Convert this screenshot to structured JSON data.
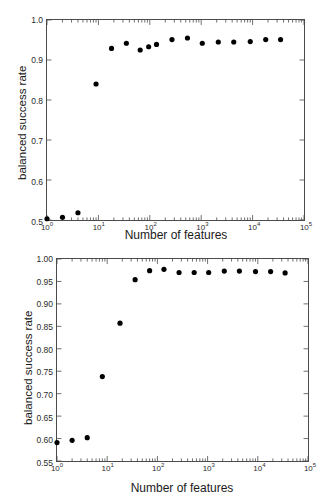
{
  "chart_data": [
    {
      "id": "top",
      "type": "scatter",
      "title": "",
      "xlabel": "Number of features",
      "ylabel": "balanced success rate",
      "xscale": "log",
      "xlim": [
        1,
        100000
      ],
      "ylim": [
        0.5,
        1.0
      ],
      "grid": false,
      "legend": false,
      "xticks": [
        1,
        10,
        100,
        1000,
        10000,
        100000
      ],
      "xticklabels": [
        "10",
        "10",
        "10",
        "10",
        "10",
        "10"
      ],
      "xtickexp": [
        "0",
        "1",
        "2",
        "3",
        "4",
        "5"
      ],
      "yticks": [
        0.5,
        0.6,
        0.7,
        0.8,
        0.9,
        1.0
      ],
      "yticklabels": [
        "0.5",
        "0.6",
        "0.7",
        "0.8",
        "0.9",
        "1.0"
      ],
      "marker": "circle",
      "marker_color": "#000000",
      "x": [
        1,
        2,
        4,
        9,
        18,
        35,
        65,
        95,
        135,
        270,
        540,
        1050,
        2150,
        4300,
        9000,
        18000,
        35000
      ],
      "y": [
        0.503,
        0.507,
        0.518,
        0.84,
        0.929,
        0.942,
        0.925,
        0.933,
        0.939,
        0.951,
        0.955,
        0.942,
        0.945,
        0.945,
        0.946,
        0.951,
        0.951
      ]
    },
    {
      "id": "bottom",
      "type": "scatter",
      "title": "",
      "xlabel": "Number of features",
      "ylabel": "balanced success rate",
      "xscale": "log",
      "xlim": [
        1,
        100000
      ],
      "ylim": [
        0.55,
        1.0
      ],
      "grid": false,
      "legend": false,
      "xticks": [
        1,
        10,
        100,
        1000,
        10000,
        100000
      ],
      "xticklabels": [
        "10",
        "10",
        "10",
        "10",
        "10",
        "10"
      ],
      "xtickexp": [
        "0",
        "1",
        "2",
        "3",
        "4",
        "5"
      ],
      "yticks": [
        0.55,
        0.6,
        0.65,
        0.7,
        0.75,
        0.8,
        0.85,
        0.9,
        0.95,
        1.0
      ],
      "yticklabels": [
        "0.55",
        "0.60",
        "0.65",
        "0.70",
        "0.75",
        "0.80",
        "0.85",
        "0.90",
        "0.95",
        "1.00"
      ],
      "marker": "circle",
      "marker_color": "#000000",
      "x": [
        1,
        2,
        4,
        8,
        18,
        36,
        70,
        135,
        270,
        540,
        1050,
        2150,
        4300,
        9000,
        18000,
        35000
      ],
      "y": [
        0.591,
        0.596,
        0.602,
        0.738,
        0.857,
        0.954,
        0.974,
        0.977,
        0.97,
        0.97,
        0.97,
        0.973,
        0.973,
        0.972,
        0.972,
        0.969
      ]
    }
  ],
  "figures": {
    "top": {
      "xlabel": "Number of features",
      "ylabel": "balanced success rate"
    },
    "bottom": {
      "xlabel": "Number of features",
      "ylabel": "balanced success rate"
    }
  }
}
